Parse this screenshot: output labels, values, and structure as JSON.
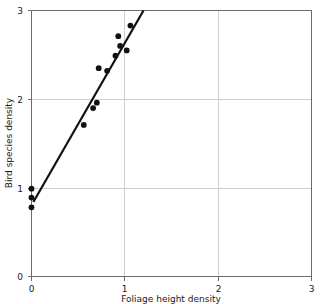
{
  "chart_data": {
    "type": "scatter",
    "title": "",
    "subtitle": "",
    "xlabel": "Foliage height density",
    "ylabel": "Bird species density",
    "xlim": [
      0,
      3
    ],
    "ylim": [
      0,
      3
    ],
    "xticks": [
      "0",
      "1",
      "2",
      "3"
    ],
    "yticks": [
      "0",
      "1",
      "2",
      "3"
    ],
    "xtick_values": [
      0,
      1,
      2,
      3
    ],
    "ytick_values": [
      0,
      1,
      2,
      3
    ],
    "grid": true,
    "legend": null,
    "legend_position": "none",
    "series": [
      {
        "name": "observations",
        "marker": "filled-circle",
        "color": "#111111",
        "points": [
          {
            "x": 0.0,
            "y": 0.99
          },
          {
            "x": 0.0,
            "y": 0.89
          },
          {
            "x": 0.0,
            "y": 0.78
          },
          {
            "x": 0.56,
            "y": 1.71
          },
          {
            "x": 0.66,
            "y": 1.9
          },
          {
            "x": 0.7,
            "y": 1.96
          },
          {
            "x": 0.72,
            "y": 2.35
          },
          {
            "x": 0.81,
            "y": 2.32
          },
          {
            "x": 0.9,
            "y": 2.49
          },
          {
            "x": 0.93,
            "y": 2.71
          },
          {
            "x": 0.95,
            "y": 2.6
          },
          {
            "x": 1.02,
            "y": 2.55
          },
          {
            "x": 1.06,
            "y": 2.83
          }
        ]
      }
    ],
    "fit_line": {
      "name": "regression-line",
      "color": "#111111",
      "x0": 0.02,
      "y0": 0.84,
      "x1": 1.2,
      "y1": 3.0
    },
    "annotations": []
  },
  "labels": {
    "x_axis_title": "Foliage height density",
    "y_axis_title": "Bird species density"
  }
}
